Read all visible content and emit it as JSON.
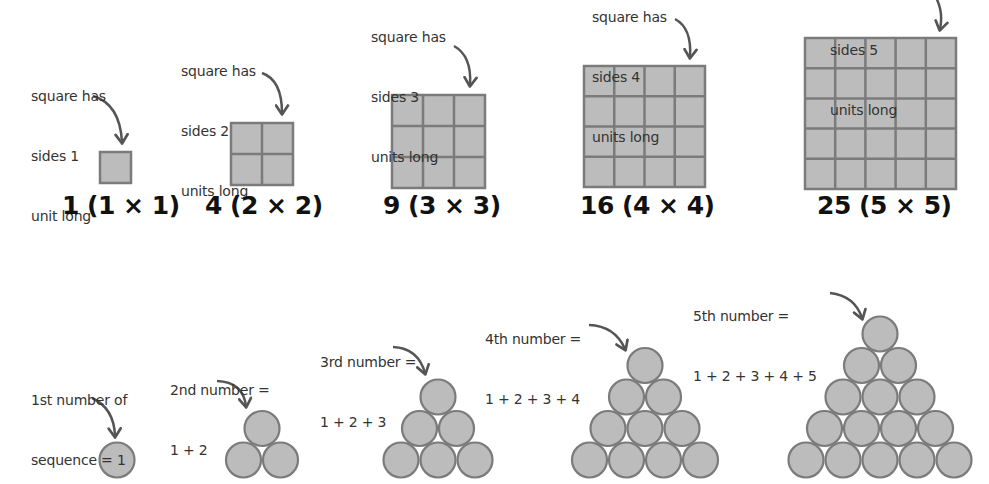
{
  "colors": {
    "shape_fill": "#bcbcbc",
    "shape_stroke": "#7b7b7b",
    "arrow": "#555555",
    "text": "#333333",
    "label": "#111111"
  },
  "square_numbers": {
    "items": [
      {
        "n": 1,
        "label": "1 (1 × 1)",
        "note": [
          "square has",
          "sides 1",
          "unit long"
        ],
        "square": {
          "x": 100,
          "y": 152,
          "size": 31
        },
        "label_pos": {
          "x": 62,
          "y": 191
        },
        "note_pos": {
          "x": 31,
          "y": 46
        },
        "arrow": "M 93 96 Q 120 104 122 142"
      },
      {
        "n": 2,
        "label": "4 (2 × 2)",
        "note": [
          "square has",
          "sides 2",
          "units long"
        ],
        "square": {
          "x": 231,
          "y": 123,
          "size": 62
        },
        "label_pos": {
          "x": 205,
          "y": 191
        },
        "note_pos": {
          "x": 181,
          "y": 21
        },
        "arrow": "M 262 73 Q 282 80 282 113"
      },
      {
        "n": 3,
        "label": "9 (3 × 3)",
        "note": [
          "square has",
          "sides 3",
          "units long"
        ],
        "square": {
          "x": 392,
          "y": 95,
          "size": 93
        },
        "label_pos": {
          "x": 383,
          "y": 191
        },
        "note_pos": {
          "x": 371,
          "y": -13
        },
        "arrow": "M 454 46 Q 472 56 470 85"
      },
      {
        "n": 4,
        "label": "16 (4 × 4)",
        "note": [
          "square has",
          "sides 4",
          "units long"
        ],
        "square": {
          "x": 584,
          "y": 66,
          "size": 121
        },
        "label_pos": {
          "x": 580,
          "y": 191
        },
        "note_pos": {
          "x": 592,
          "y": -33
        },
        "arrow": "M 675 19 Q 692 28 690 57"
      },
      {
        "n": 5,
        "label": "25 (5 × 5)",
        "note": [
          "square has",
          "sides 5",
          "units long"
        ],
        "square": {
          "x": 805,
          "y": 38,
          "size": 151
        },
        "label_pos": {
          "x": 817,
          "y": 191
        },
        "note_pos": {
          "x": 830,
          "y": -60
        },
        "arrow": "M 934 -6 Q 944 10 940 29"
      }
    ]
  },
  "triangular_numbers": {
    "circle_diameter": 37,
    "row_step": 31.5,
    "items": [
      {
        "n": 1,
        "value": 1,
        "note": [
          "1st number of",
          "sequence = 1"
        ],
        "top": {
          "x": 117,
          "y": 460
        },
        "note_pos": {
          "x": 31,
          "y": 350
        },
        "arrow": "M 92 398 Q 114 408 115 436"
      },
      {
        "n": 2,
        "value": 3,
        "note": [
          "2nd number =",
          "1 + 2"
        ],
        "top": {
          "x": 262,
          "y": 428.5
        },
        "note_pos": {
          "x": 170,
          "y": 340
        },
        "arrow": "M 217 381 Q 243 382 246 406"
      },
      {
        "n": 3,
        "value": 6,
        "note": [
          "3rd number =",
          "1 + 2 + 3"
        ],
        "top": {
          "x": 438,
          "y": 397
        },
        "note_pos": {
          "x": 320,
          "y": 312
        },
        "arrow": "M 393 347 Q 418 348 425 373"
      },
      {
        "n": 4,
        "value": 10,
        "note": [
          "4th number =",
          "1 + 2 + 3 + 4"
        ],
        "top": {
          "x": 645,
          "y": 365.5
        },
        "note_pos": {
          "x": 485,
          "y": 289
        },
        "arrow": "M 589 325 Q 615 326 625 349"
      },
      {
        "n": 5,
        "value": 15,
        "note": [
          "5th number =",
          "1 + 2 + 3 + 4 + 5"
        ],
        "top": {
          "x": 880,
          "y": 334
        },
        "note_pos": {
          "x": 693,
          "y": 266
        },
        "arrow": "M 830 293 Q 855 296 862 318"
      }
    ]
  }
}
